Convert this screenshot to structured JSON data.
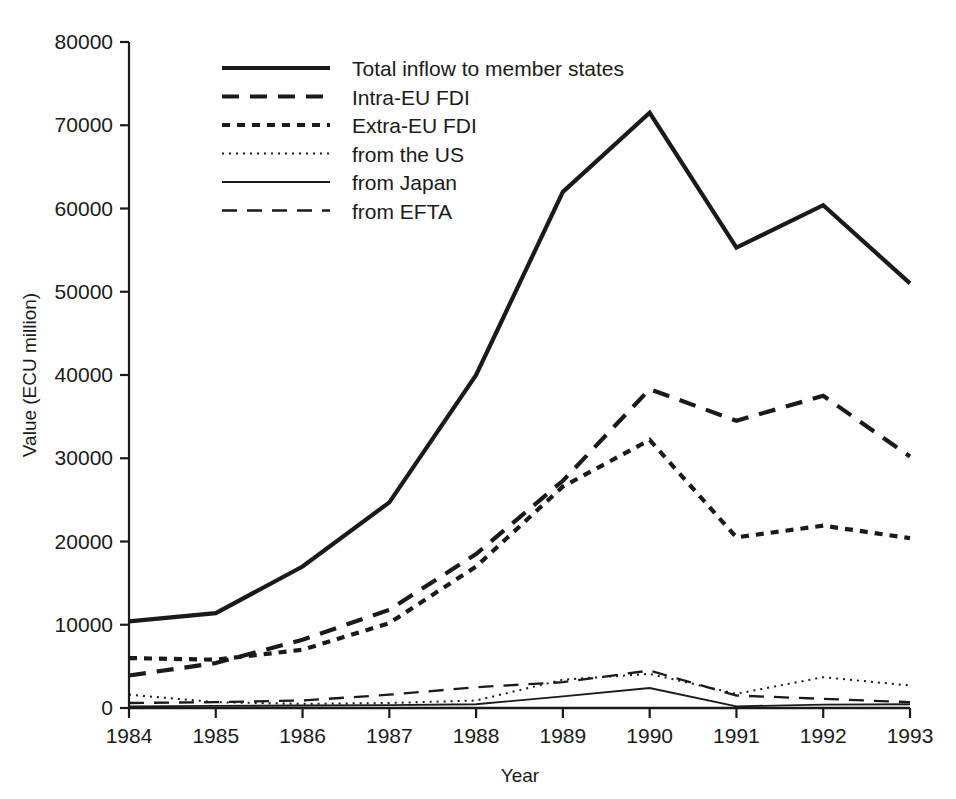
{
  "chart_data": {
    "type": "line",
    "title": "",
    "xlabel": "Year",
    "ylabel": "Value (ECU million)",
    "categories": [
      "1984",
      "1985",
      "1986",
      "1987",
      "1988",
      "1989",
      "1990",
      "1991",
      "1992",
      "1993"
    ],
    "x": [
      1984,
      1985,
      1986,
      1987,
      1988,
      1989,
      1990,
      1991,
      1992,
      1993
    ],
    "xlim": [
      1984,
      1993
    ],
    "ylim": [
      0,
      80000
    ],
    "ytick_labels": [
      "0",
      "10000",
      "20000",
      "30000",
      "40000",
      "50000",
      "60000",
      "70000",
      "80000"
    ],
    "yticks": [
      0,
      10000,
      20000,
      30000,
      40000,
      50000,
      60000,
      70000,
      80000
    ],
    "grid": false,
    "legend_position": "upper-left-inside",
    "series": [
      {
        "name": "Total inflow to member states",
        "style": "solid-thick",
        "values": [
          10400,
          11400,
          17000,
          24700,
          40000,
          62000,
          71500,
          55300,
          60400,
          51000
        ]
      },
      {
        "name": "Intra-EU FDI",
        "style": "dash-long-bold",
        "values": [
          3900,
          5400,
          8200,
          11800,
          18500,
          27300,
          38300,
          34500,
          37500,
          30200
        ]
      },
      {
        "name": "Extra-EU FDI",
        "style": "dash-short-bold",
        "values": [
          6000,
          5800,
          7000,
          10200,
          17000,
          26600,
          32200,
          20500,
          21900,
          20400
        ]
      },
      {
        "name": "from the US",
        "style": "dotted-fine",
        "values": [
          1600,
          700,
          500,
          600,
          900,
          3400,
          4100,
          1700,
          3700,
          2700
        ]
      },
      {
        "name": "from Japan",
        "style": "solid-thin",
        "values": [
          200,
          250,
          300,
          350,
          450,
          1400,
          2400,
          200,
          400,
          450
        ]
      },
      {
        "name": "from EFTA",
        "style": "dash-long-thin",
        "values": [
          600,
          700,
          900,
          1600,
          2500,
          3100,
          4500,
          1500,
          1100,
          700
        ]
      }
    ]
  },
  "axes": {
    "y_title": "Value (ECU million)",
    "x_title": "Year"
  },
  "legend": {
    "entries": [
      {
        "label": "Total inflow to member states",
        "style": "solid-thick"
      },
      {
        "label": "Intra-EU FDI",
        "style": "dash-long-bold"
      },
      {
        "label": "Extra-EU FDI",
        "style": "dash-short-bold"
      },
      {
        "label": "from the US",
        "style": "dotted-fine"
      },
      {
        "label": "from Japan",
        "style": "solid-thin"
      },
      {
        "label": "from EFTA",
        "style": "dash-long-thin"
      }
    ]
  },
  "colors": {
    "ink": "#1a1a1a",
    "background": "#ffffff"
  }
}
